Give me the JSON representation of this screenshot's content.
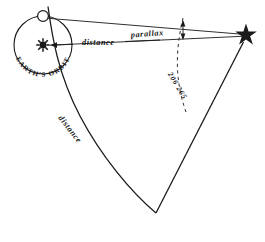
{
  "diagram": {
    "labels": {
      "distance_upper": "distance",
      "distance_lower": "distance",
      "parallax": "parallax",
      "earths_orbit": "EARTH'S ORBIT",
      "arcseconds": "206 265"
    },
    "markers": {
      "star": "star-marker",
      "earth": "earth-position-marker",
      "sun": "sun-marker"
    },
    "colors": {
      "ink": "#1a1a1a",
      "background": "#ffffff"
    },
    "geometry": {
      "sun_center_x": 43,
      "sun_center_y": 45,
      "orbit_radius": 29,
      "earth_x": 43,
      "earth_y": 16,
      "star_x": 246,
      "star_y": 35,
      "bottom_vertex_x": 156,
      "bottom_vertex_y": 213
    }
  }
}
